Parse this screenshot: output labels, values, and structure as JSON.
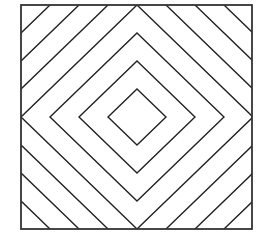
{
  "figure": {
    "canvas": {
      "width": 263,
      "height": 239,
      "background": "#ffffff"
    },
    "square": {
      "x": 21,
      "y": 5,
      "width": 231,
      "height": 224,
      "stroke": "#333333",
      "stroke_width": 1.8
    },
    "center": {
      "x": 137,
      "y": 117
    },
    "diamonds": {
      "count": 7,
      "step_x": 29,
      "step_y": 28,
      "stroke": "#222222",
      "stroke_width": 1.4
    }
  }
}
